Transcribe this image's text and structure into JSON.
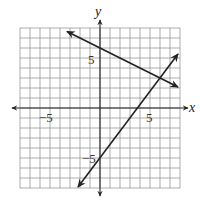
{
  "chart_data": {
    "type": "line",
    "title": "",
    "xlabel": "x",
    "ylabel": "y",
    "xlim": [
      -8,
      8
    ],
    "ylim": [
      -8,
      8
    ],
    "grid": true,
    "grid_step": 1,
    "tick_labels": {
      "x": [
        "-5",
        "5"
      ],
      "y": [
        "5",
        "-5"
      ]
    },
    "series": [
      {
        "name": "line-decreasing",
        "equation": "y = -x/2 + 6",
        "slope": -0.5,
        "intercept": 6,
        "x": [
          -3.3,
          7.8
        ],
        "y": [
          7.65,
          2.1
        ],
        "arrows": "both"
      },
      {
        "name": "line-increasing",
        "equation": "y = (4/3)x - 5",
        "slope": 1.3333,
        "intercept": -5,
        "x": [
          -2.2,
          7.8
        ],
        "y": [
          -7.9,
          5.4
        ],
        "arrows": "both"
      }
    ],
    "intersection": {
      "x": 6,
      "y": 3
    }
  },
  "labels": {
    "x_axis": "x",
    "y_axis": "y",
    "x_neg": "−5",
    "x_pos": "5",
    "y_pos": "5",
    "y_neg": "−5"
  }
}
